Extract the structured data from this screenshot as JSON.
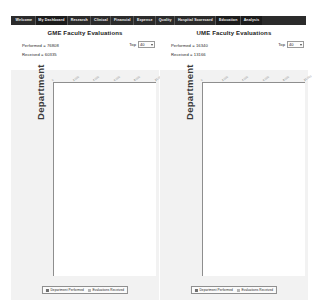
{
  "nav": {
    "items": [
      {
        "label": "Welcome",
        "active": false
      },
      {
        "label": "My Dashboard",
        "active": true
      },
      {
        "label": "Research",
        "active": false
      },
      {
        "label": "Clinical",
        "active": false
      },
      {
        "label": "Financial",
        "active": false
      },
      {
        "label": "Expense",
        "active": false
      },
      {
        "label": "Quality",
        "active": false
      },
      {
        "label": "Hospital Scorecard",
        "active": false
      },
      {
        "label": "Education",
        "active": true
      },
      {
        "label": "Analysis",
        "active": true
      }
    ]
  },
  "panels": [
    {
      "title": "GME Faculty Evaluations",
      "performed_label": "Performed = 76808",
      "received_label": "Received = 60335",
      "top_label": "Top",
      "top_value": "40",
      "top_options": [
        "10",
        "20",
        "40",
        "60",
        "100"
      ],
      "ylabel": "Department",
      "legend": [
        {
          "label": "Department Performed",
          "color": "#6f6f6f"
        },
        {
          "label": "Evaluations Received",
          "color": "#b5b5b5"
        }
      ],
      "chart_data": {
        "type": "bar",
        "orientation": "horizontal",
        "stacked": true,
        "title": "GME Faculty Evaluations",
        "xlabel": "",
        "ylabel": "Department",
        "xlim": [
          0,
          10000
        ],
        "ticks": [
          "0",
          "2,000",
          "4,000",
          "6,000",
          "8,000",
          "10,000"
        ],
        "grid": false,
        "legend_position": "bottom",
        "categories": [
          "Internal Medicine",
          "Surgery",
          "Pediatrics",
          "Anesthesiology",
          "Family Medicine",
          "Emergency Medicine",
          "Psychiatry",
          "Radiology",
          "Obstetrics & Gynecology",
          "Neurology",
          "Pathology",
          "Orthopaedics",
          "Dermatology",
          "Ophthalmology",
          "Urology",
          "Otolaryngology",
          "Physical Medicine",
          "Plastic Surgery",
          "Neurosurgery",
          "Radiation Oncology",
          "Nuclear Medicine",
          "Vascular Surgery",
          "Thoracic Surgery",
          "Medical Genetics",
          "Allergy & Immunology",
          "Colon & Rectal Surgery",
          "Preventive Medicine",
          "Transitional Year",
          "Oral Surgery",
          "Podiatry",
          "Clinical Pharmacology",
          "Sleep Medicine",
          "Pain Medicine",
          "Hospice & Palliative",
          "Sports Medicine",
          "Critical Care",
          "Geriatrics",
          "Hematology",
          "Infectious Disease",
          "Nephrology"
        ],
        "series": [
          {
            "name": "Department Performed",
            "color": "#6f6f6f",
            "values": [
              3760,
              3180,
              3060,
              3010,
              1420,
              1260,
              1180,
              1100,
              1030,
              960,
              880,
              800,
              730,
              660,
              600,
              540,
              480,
              430,
              380,
              340,
              300,
              265,
              235,
              205,
              180,
              158,
              138,
              120,
              104,
              90,
              78,
              67,
              57,
              48,
              40,
              33,
              27,
              22,
              17,
              13
            ]
          },
          {
            "name": "Evaluations Received",
            "color": "#b5b5b5",
            "values": [
              5620,
              3140,
              1880,
              1190,
              600,
              420,
              330,
              250,
              210,
              180,
              150,
              120,
              100,
              85,
              70,
              58,
              48,
              40,
              33,
              27,
              22,
              18,
              15,
              12,
              10,
              8,
              7,
              6,
              5,
              4,
              3,
              3,
              2,
              2,
              2,
              1,
              1,
              1,
              1,
              1
            ]
          }
        ]
      }
    },
    {
      "title": "UME Faculty Evaluations",
      "performed_label": "Performed = 16340",
      "received_label": "Received = 13166",
      "top_label": "Top",
      "top_value": "40",
      "top_options": [
        "10",
        "20",
        "40",
        "60",
        "100"
      ],
      "ylabel": "Department",
      "legend": [
        {
          "label": "Department Performed",
          "color": "#6f6f6f"
        },
        {
          "label": "Evaluations Received",
          "color": "#b5b5b5"
        }
      ],
      "chart_data": {
        "type": "bar",
        "orientation": "horizontal",
        "stacked": true,
        "title": "UME Faculty Evaluations",
        "xlabel": "",
        "ylabel": "Department",
        "xlim": [
          0,
          10000
        ],
        "ticks": [
          "0",
          "2,000",
          "4,000",
          "6,000",
          "8,000",
          "10,000"
        ],
        "grid": false,
        "legend_position": "bottom",
        "categories": [
          "Internal Medicine",
          "Surgery",
          "Pediatrics",
          "Family Medicine",
          "Obstetrics & Gynecology",
          "Psychiatry",
          "Neurology",
          "Emergency Medicine",
          "Anesthesiology",
          "Radiology",
          "Pathology",
          "Dermatology",
          "Ophthalmology",
          "Orthopaedics",
          "Urology",
          "Otolaryngology",
          "Physical Medicine",
          "Geriatrics",
          "Neurosurgery",
          "Plastic Surgery",
          "Radiation Oncology",
          "Nuclear Medicine",
          "Thoracic Surgery",
          "Vascular Surgery",
          "Medical Genetics",
          "Allergy & Immunology",
          "Colon & Rectal Surgery",
          "Preventive Medicine",
          "Transitional Year",
          "Oral Surgery",
          "Podiatry",
          "Clinical Pharmacology",
          "Sleep Medicine",
          "Pain Medicine",
          "Hospice & Palliative",
          "Sports Medicine",
          "Critical Care",
          "Hematology",
          "Infectious Disease",
          "Nephrology"
        ],
        "series": [
          {
            "name": "Department Performed",
            "color": "#6f6f6f",
            "values": [
              4100,
              3120,
              1560,
              880,
              700,
              560,
              420,
              300,
              210,
              160,
              120,
              95,
              75,
              60,
              48,
              38,
              30,
              25,
              20,
              16,
              13,
              11,
              9,
              7,
              6,
              5,
              4,
              4,
              3,
              3,
              2,
              2,
              2,
              1,
              1,
              1,
              1,
              1,
              1,
              1
            ]
          },
          {
            "name": "Evaluations Received",
            "color": "#b5b5b5",
            "values": [
              6500,
              1180,
              260,
              120,
              70,
              45,
              30,
              20,
              14,
              10,
              8,
              6,
              5,
              4,
              3,
              3,
              2,
              2,
              2,
              1,
              1,
              1,
              1,
              1,
              1,
              1,
              1,
              1,
              1,
              1,
              1,
              1,
              1,
              1,
              1,
              1,
              1,
              1,
              1,
              1
            ]
          }
        ]
      }
    }
  ]
}
